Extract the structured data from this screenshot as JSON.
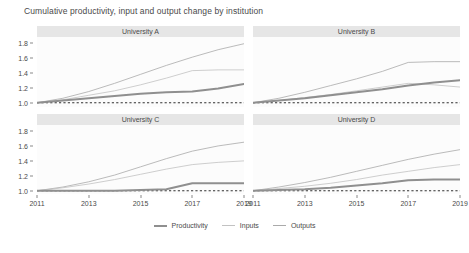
{
  "chart_data": {
    "type": "line",
    "title": "Cumulative productivity, input and output change by institution",
    "xlabel": "",
    "ylabel": "",
    "xlim": [
      2011,
      2019
    ],
    "ylim": [
      0.95,
      1.88
    ],
    "xticks": [
      "2011",
      "2013",
      "2015",
      "2017",
      "2019"
    ],
    "xtick_values": [
      2011,
      2013,
      2015,
      2017,
      2019
    ],
    "yticks": [
      "1.0",
      "1.2",
      "1.4",
      "1.6",
      "1.8"
    ],
    "ytick_values": [
      1.0,
      1.2,
      1.4,
      1.6,
      1.8
    ],
    "grid": false,
    "legend_position": "bottom",
    "reference_line": {
      "value": 1.0,
      "style": "dashed",
      "color": "#1a1a1a"
    },
    "series_colors": {
      "Productivity": "#8f8f8f",
      "Inputs": "#c2c2c2",
      "Outputs": "#aaaaaa"
    },
    "x": [
      2011,
      2012,
      2013,
      2014,
      2015,
      2016,
      2017,
      2018,
      2019
    ],
    "panels": [
      {
        "label": "University A",
        "series": [
          {
            "name": "Productivity",
            "values": [
              1.0,
              1.03,
              1.06,
              1.09,
              1.12,
              1.14,
              1.15,
              1.19,
              1.25
            ]
          },
          {
            "name": "Inputs",
            "values": [
              1.0,
              1.04,
              1.1,
              1.16,
              1.24,
              1.33,
              1.43,
              1.44,
              1.44
            ]
          },
          {
            "name": "Outputs",
            "values": [
              1.0,
              1.06,
              1.15,
              1.26,
              1.38,
              1.5,
              1.61,
              1.71,
              1.79
            ]
          }
        ]
      },
      {
        "label": "University B",
        "series": [
          {
            "name": "Productivity",
            "values": [
              1.0,
              1.03,
              1.06,
              1.1,
              1.14,
              1.18,
              1.23,
              1.27,
              1.3
            ]
          },
          {
            "name": "Inputs",
            "values": [
              1.0,
              1.03,
              1.07,
              1.11,
              1.16,
              1.21,
              1.26,
              1.24,
              1.21
            ]
          },
          {
            "name": "Outputs",
            "values": [
              1.0,
              1.06,
              1.14,
              1.23,
              1.32,
              1.42,
              1.54,
              1.55,
              1.55
            ]
          }
        ]
      },
      {
        "label": "University C",
        "series": [
          {
            "name": "Productivity",
            "values": [
              1.0,
              1.0,
              1.0,
              1.0,
              1.01,
              1.02,
              1.1,
              1.1,
              1.1
            ]
          },
          {
            "name": "Inputs",
            "values": [
              1.0,
              1.04,
              1.09,
              1.15,
              1.22,
              1.29,
              1.35,
              1.38,
              1.4
            ]
          },
          {
            "name": "Outputs",
            "values": [
              1.0,
              1.05,
              1.12,
              1.21,
              1.32,
              1.43,
              1.53,
              1.6,
              1.65
            ]
          }
        ]
      },
      {
        "label": "University D",
        "series": [
          {
            "name": "Productivity",
            "values": [
              1.0,
              1.01,
              1.02,
              1.04,
              1.07,
              1.1,
              1.14,
              1.15,
              1.15
            ]
          },
          {
            "name": "Inputs",
            "values": [
              1.0,
              1.03,
              1.06,
              1.1,
              1.15,
              1.21,
              1.26,
              1.31,
              1.35
            ]
          },
          {
            "name": "Outputs",
            "values": [
              1.0,
              1.05,
              1.11,
              1.18,
              1.26,
              1.34,
              1.42,
              1.49,
              1.55
            ]
          }
        ]
      }
    ],
    "legend": [
      {
        "label": "Productivity"
      },
      {
        "label": "Inputs"
      },
      {
        "label": "Outputs"
      }
    ]
  }
}
